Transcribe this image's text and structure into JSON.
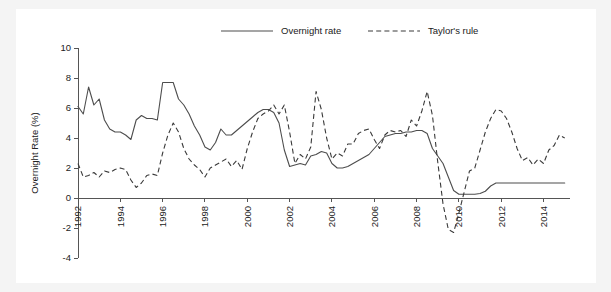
{
  "chart_data": {
    "type": "line",
    "title": "",
    "xlabel": "",
    "ylabel": "Overnight Rate (%)",
    "ylim": [
      -4,
      10
    ],
    "xlim": [
      1992,
      2015.25
    ],
    "yticks": [
      -4,
      -2,
      0,
      2,
      4,
      6,
      8,
      10
    ],
    "xticks": [
      1992,
      1994,
      1996,
      1998,
      2000,
      2002,
      2004,
      2006,
      2008,
      2010,
      2012,
      2014
    ],
    "ytick_labels": [
      "-4",
      "-2",
      "0",
      "2",
      "4",
      "6",
      "8",
      "10"
    ],
    "xtick_labels": [
      "1992",
      "1994",
      "1996",
      "1998",
      "2000",
      "2002",
      "2004",
      "2006",
      "2008",
      "2010",
      "2012",
      "2014"
    ],
    "grid": false,
    "legend_position": "top-center",
    "legend": [
      {
        "name": "Overnight rate",
        "style": "solid",
        "color": "#4d4d4d"
      },
      {
        "name": "Taylor's rule",
        "style": "dashed",
        "color": "#3a3a3a"
      }
    ],
    "series": [
      {
        "name": "Overnight rate",
        "style": "solid",
        "color": "#4d4d4d",
        "x": [
          1992.0,
          1992.25,
          1992.5,
          1992.75,
          1993.0,
          1993.25,
          1993.5,
          1993.75,
          1994.0,
          1994.25,
          1994.5,
          1994.75,
          1995.0,
          1995.25,
          1995.5,
          1995.75,
          1996.0,
          1996.25,
          1996.5,
          1996.75,
          1997.0,
          1997.25,
          1997.5,
          1997.75,
          1998.0,
          1998.25,
          1998.5,
          1998.75,
          1999.0,
          1999.25,
          1999.5,
          1999.75,
          2000.0,
          2000.25,
          2000.5,
          2000.75,
          2001.0,
          2001.25,
          2001.5,
          2001.75,
          2002.0,
          2002.25,
          2002.5,
          2002.75,
          2003.0,
          2003.25,
          2003.5,
          2003.75,
          2004.0,
          2004.25,
          2004.5,
          2004.75,
          2005.0,
          2005.25,
          2005.5,
          2005.75,
          2006.0,
          2006.25,
          2006.5,
          2006.75,
          2007.0,
          2007.25,
          2007.5,
          2007.75,
          2008.0,
          2008.25,
          2008.5,
          2008.75,
          2009.0,
          2009.25,
          2009.5,
          2009.75,
          2010.0,
          2010.25,
          2010.5,
          2010.75,
          2011.0,
          2011.25,
          2011.5,
          2011.75,
          2012.0,
          2012.25,
          2012.5,
          2012.75,
          2013.0,
          2013.25,
          2013.5,
          2013.75,
          2014.0,
          2014.25,
          2014.5,
          2014.75,
          2015.0
        ],
        "y": [
          6.1,
          5.6,
          7.4,
          6.2,
          6.6,
          5.2,
          4.6,
          4.4,
          4.4,
          4.2,
          3.9,
          5.2,
          5.5,
          5.3,
          5.3,
          5.2,
          7.7,
          7.7,
          7.7,
          6.6,
          6.2,
          5.6,
          4.8,
          4.2,
          3.4,
          3.2,
          3.7,
          4.6,
          4.2,
          4.2,
          4.5,
          4.8,
          5.1,
          5.4,
          5.7,
          5.9,
          5.9,
          5.7,
          5.0,
          3.2,
          2.1,
          2.2,
          2.3,
          2.2,
          2.8,
          2.9,
          3.1,
          3.0,
          2.3,
          2.0,
          2.0,
          2.1,
          2.3,
          2.5,
          2.7,
          2.9,
          3.3,
          3.7,
          4.1,
          4.2,
          4.3,
          4.3,
          4.4,
          4.4,
          4.5,
          4.5,
          4.3,
          3.3,
          2.8,
          2.3,
          1.4,
          0.5,
          0.25,
          0.25,
          0.25,
          0.25,
          0.3,
          0.45,
          0.8,
          1.0,
          1.0,
          1.0,
          1.0,
          1.0,
          1.0,
          1.0,
          1.0,
          1.0,
          1.0,
          1.0,
          1.0,
          1.0,
          1.0
        ]
      },
      {
        "name": "Taylor's rule",
        "style": "dashed",
        "color": "#3a3a3a",
        "x": [
          1992.0,
          1992.25,
          1992.5,
          1992.75,
          1993.0,
          1993.25,
          1993.5,
          1993.75,
          1994.0,
          1994.25,
          1994.5,
          1994.75,
          1995.0,
          1995.25,
          1995.5,
          1995.75,
          1996.0,
          1996.25,
          1996.5,
          1996.75,
          1997.0,
          1997.25,
          1997.5,
          1997.75,
          1998.0,
          1998.25,
          1998.5,
          1998.75,
          1999.0,
          1999.25,
          1999.5,
          1999.75,
          2000.0,
          2000.25,
          2000.5,
          2000.75,
          2001.0,
          2001.25,
          2001.5,
          2001.75,
          2002.0,
          2002.25,
          2002.5,
          2002.75,
          2003.0,
          2003.25,
          2003.5,
          2003.75,
          2004.0,
          2004.25,
          2004.5,
          2004.75,
          2005.0,
          2005.25,
          2005.5,
          2005.75,
          2006.0,
          2006.25,
          2006.5,
          2006.75,
          2007.0,
          2007.25,
          2007.5,
          2007.75,
          2008.0,
          2008.25,
          2008.5,
          2008.75,
          2009.0,
          2009.25,
          2009.5,
          2009.75,
          2010.0,
          2010.25,
          2010.5,
          2010.75,
          2011.0,
          2011.25,
          2011.5,
          2011.75,
          2012.0,
          2012.25,
          2012.5,
          2012.75,
          2013.0,
          2013.25,
          2013.5,
          2013.75,
          2014.0,
          2014.25,
          2014.5,
          2014.75,
          2015.0
        ],
        "y": [
          2.3,
          1.4,
          1.5,
          1.7,
          1.4,
          1.8,
          1.7,
          1.9,
          2.0,
          1.9,
          1.2,
          0.7,
          1.0,
          1.5,
          1.6,
          1.5,
          3.0,
          4.2,
          5.0,
          4.4,
          3.3,
          2.6,
          2.2,
          1.9,
          1.4,
          2.0,
          2.2,
          2.4,
          2.6,
          2.1,
          2.5,
          1.9,
          3.3,
          4.4,
          5.3,
          5.6,
          5.8,
          6.2,
          5.6,
          6.2,
          4.4,
          2.3,
          2.9,
          2.6,
          3.4,
          7.1,
          5.9,
          4.0,
          2.6,
          3.0,
          2.8,
          3.6,
          3.6,
          4.3,
          4.5,
          4.6,
          3.9,
          3.3,
          4.2,
          4.5,
          4.4,
          4.5,
          4.1,
          5.2,
          4.8,
          5.8,
          7.1,
          5.5,
          2.4,
          -0.4,
          -2.1,
          -2.3,
          -1.0,
          0.4,
          1.8,
          2.0,
          3.2,
          4.4,
          5.3,
          5.9,
          5.8,
          5.3,
          4.4,
          3.3,
          2.5,
          2.7,
          2.2,
          2.6,
          2.3,
          3.2,
          3.5,
          4.2,
          4.0
        ]
      }
    ]
  }
}
